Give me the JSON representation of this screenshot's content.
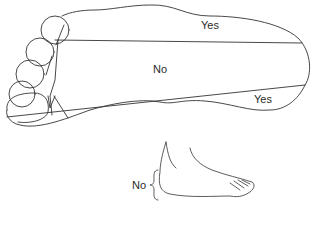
{
  "diagram": {
    "sole": {
      "regions": [
        {
          "id": "upper",
          "label": "Yes"
        },
        {
          "id": "middle",
          "label": "No"
        },
        {
          "id": "lower",
          "label": "Yes"
        }
      ]
    },
    "side_view": {
      "label": "No"
    },
    "colors": {
      "stroke": "#333333",
      "text": "#2a2a2a",
      "background": "#ffffff"
    }
  }
}
